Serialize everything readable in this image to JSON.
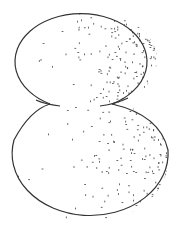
{
  "figure": {
    "stroke_color": "#333333",
    "stipple_color": "#444444",
    "background": "#ffffff",
    "top_lobe": {
      "cx": 91,
      "cy": 60,
      "rx": 66,
      "ry": 48
    },
    "bottom_lobe": {
      "cx": 90,
      "cy": 160,
      "rx": 78,
      "ry": 62
    }
  }
}
